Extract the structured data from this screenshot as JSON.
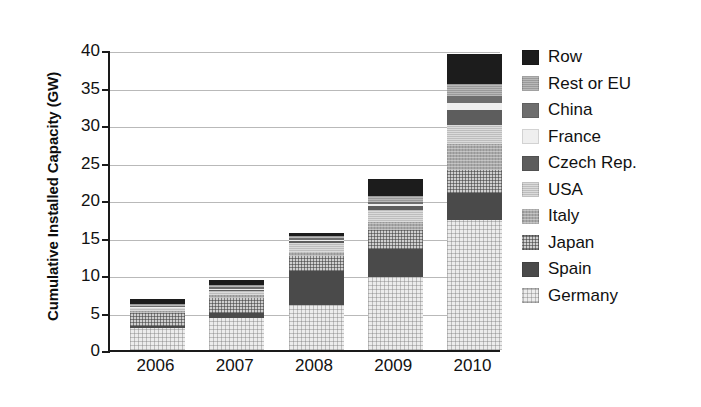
{
  "chart_data": {
    "type": "bar",
    "title": "",
    "subtitle": "",
    "stacked": true,
    "xlabel": "",
    "ylabel": "Cumulative Installed Capacity (GW)",
    "categories": [
      "2006",
      "2007",
      "2008",
      "2009",
      "2010"
    ],
    "ylim": [
      0,
      40
    ],
    "yticks": [
      0,
      5,
      10,
      15,
      20,
      25,
      30,
      35,
      40
    ],
    "ytick_labels": [
      "0",
      "5",
      "10",
      "15",
      "20",
      "25",
      "30",
      "35",
      "40"
    ],
    "grid": true,
    "grid_axis": "y",
    "legend_position": "right",
    "series_order_bottom_to_top": [
      "Germany",
      "Spain",
      "Japan",
      "Italy",
      "USA",
      "Czech Rep.",
      "France",
      "China",
      "Rest or EU",
      "Row"
    ],
    "series": [
      {
        "name": "Germany",
        "fill": "germany",
        "color": "#ececec",
        "values": [
          3.0,
          4.3,
          6.0,
          9.8,
          17.3
        ]
      },
      {
        "name": "Spain",
        "fill": "spain",
        "color": "#4a4a4a",
        "values": [
          0.2,
          0.7,
          4.5,
          3.7,
          3.7
        ]
      },
      {
        "name": "Japan",
        "fill": "japan",
        "color": "#cfcfcf",
        "values": [
          1.7,
          1.9,
          2.1,
          2.5,
          3.0
        ]
      },
      {
        "name": "Italy",
        "fill": "italy",
        "color": "#a8a8a8",
        "values": [
          0.3,
          0.4,
          0.5,
          1.1,
          3.5
        ]
      },
      {
        "name": "USA",
        "fill": "usa",
        "color": "#bdbdbd",
        "values": [
          0.5,
          0.6,
          1.2,
          1.6,
          2.5
        ]
      },
      {
        "name": "Czech Rep.",
        "fill": "czech",
        "color": "#5d5d5d",
        "values": [
          0.0,
          0.1,
          0.2,
          0.5,
          2.0
        ]
      },
      {
        "name": "France",
        "fill": "france",
        "color": "#efefef",
        "values": [
          0.1,
          0.2,
          0.2,
          0.3,
          1.0
        ]
      },
      {
        "name": "China",
        "fill": "china",
        "color": "#6e6e6e",
        "values": [
          0.1,
          0.2,
          0.2,
          0.3,
          0.9
        ]
      },
      {
        "name": "Rest or EU",
        "fill": "resteu",
        "color": "#9a9a9a",
        "values": [
          0.3,
          0.3,
          0.3,
          0.7,
          1.6
        ]
      },
      {
        "name": "Row",
        "fill": "row",
        "color": "#1c1c1c",
        "values": [
          0.6,
          0.6,
          0.4,
          2.3,
          4.0
        ]
      }
    ],
    "totals": [
      6.8,
      9.3,
      15.6,
      22.8,
      39.5
    ]
  },
  "legend": {
    "items": [
      {
        "label": "Row",
        "fill": "row"
      },
      {
        "label": "Rest or EU",
        "fill": "resteu"
      },
      {
        "label": "China",
        "fill": "china"
      },
      {
        "label": "France",
        "fill": "france"
      },
      {
        "label": "Czech Rep.",
        "fill": "czech"
      },
      {
        "label": "USA",
        "fill": "usa"
      },
      {
        "label": "Italy",
        "fill": "italy"
      },
      {
        "label": "Japan",
        "fill": "japan"
      },
      {
        "label": "Spain",
        "fill": "spain"
      },
      {
        "label": "Germany",
        "fill": "germany"
      }
    ]
  }
}
